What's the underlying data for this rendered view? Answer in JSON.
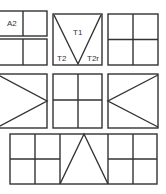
{
  "diagram": {
    "stroke_color": "#333333",
    "background": "#ffffff",
    "tiles": [
      {
        "id": "top-left",
        "pattern": "two-stacked-halves-split",
        "labels": [
          "A2"
        ]
      },
      {
        "id": "top-center",
        "pattern": "inverted-triangle",
        "labels": [
          "T1",
          "T2",
          "T2r"
        ]
      },
      {
        "id": "top-right",
        "pattern": "four-quadrants",
        "labels": []
      },
      {
        "id": "middle-left",
        "pattern": "triangle-pointing-right",
        "labels": []
      },
      {
        "id": "middle-center",
        "pattern": "four-quadrants",
        "labels": []
      },
      {
        "id": "middle-right",
        "pattern": "triangle-pointing-left",
        "labels": []
      },
      {
        "id": "bottom-wide",
        "pattern": "quadrants-triangle-quadrants",
        "labels": []
      }
    ],
    "labels": {
      "a2": "A2",
      "t1": "T1",
      "t2": "T2",
      "t2r": "T2r"
    }
  }
}
